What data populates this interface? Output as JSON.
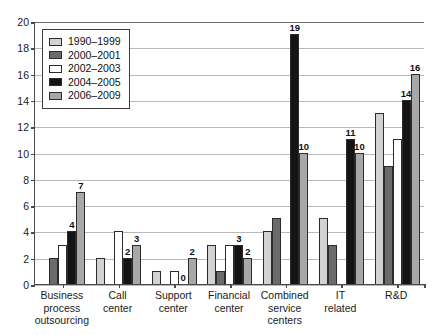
{
  "chart_data": {
    "type": "bar",
    "title": "",
    "subtitle": "",
    "xlabel": "",
    "ylabel": "",
    "ylim": [
      0,
      20
    ],
    "ytick_step": 2,
    "yticks": [
      0,
      2,
      4,
      6,
      8,
      10,
      12,
      14,
      16,
      18,
      20
    ],
    "grid": true,
    "grid_axis": "y",
    "legend_position": "top-left-inside",
    "categories": [
      "Business\nprocess\noutsourcing",
      "Call\ncenter",
      "Support\ncenter",
      "Financial\ncenter",
      "Combined\nservice\ncenters",
      "IT\nrelated",
      "R&D"
    ],
    "series": [
      {
        "name": "1990–1999",
        "color": "#d2d2d2",
        "values": [
          0,
          2,
          1,
          3,
          4,
          5,
          13
        ],
        "labels": [
          "",
          "",
          "",
          "",
          "",
          "",
          ""
        ]
      },
      {
        "name": "2000–2001",
        "color": "#6b6b6b",
        "values": [
          2,
          0,
          0,
          1,
          5,
          3,
          9
        ],
        "labels": [
          "",
          "",
          "",
          "",
          "",
          "",
          ""
        ]
      },
      {
        "name": "2002–2003",
        "color": "#ffffff",
        "values": [
          3,
          4,
          1,
          3,
          0,
          0,
          11
        ],
        "labels": [
          "",
          "",
          "",
          "",
          "",
          "",
          ""
        ]
      },
      {
        "name": "2004–2005",
        "color": "#141414",
        "values": [
          4,
          2,
          0,
          3,
          19,
          11,
          14
        ],
        "labels": [
          "4",
          "2",
          "0",
          "3",
          "19",
          "11",
          "14"
        ]
      },
      {
        "name": "2006–2009",
        "color": "#a8a8a8",
        "values": [
          7,
          3,
          2,
          2,
          10,
          10,
          16
        ],
        "labels": [
          "7",
          "3",
          "2",
          "2",
          "10",
          "10",
          "16"
        ]
      }
    ]
  },
  "legend": {
    "items": [
      {
        "label": "1990–1999"
      },
      {
        "label": "2000–2001"
      },
      {
        "label": "2002–2003"
      },
      {
        "label": "2004–2005"
      },
      {
        "label": "2006–2009"
      }
    ]
  }
}
